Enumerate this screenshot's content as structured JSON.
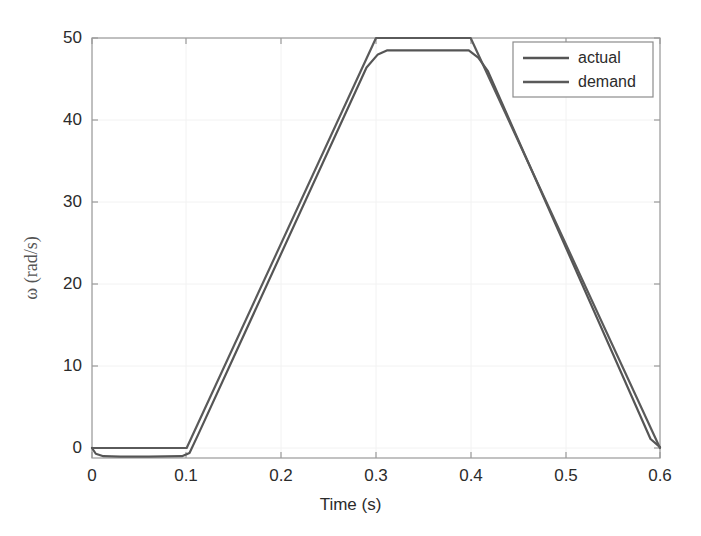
{
  "chart_data": {
    "type": "line",
    "title": "",
    "xlabel": "Time (s)",
    "ylabel": "ω (rad/s)",
    "xlim": [
      0,
      0.6
    ],
    "ylim": [
      -2.5,
      50
    ],
    "xticks": [
      0,
      0.1,
      0.2,
      0.3,
      0.4,
      0.5,
      0.6
    ],
    "xticklabels": [
      "0",
      "0.1",
      "0.2",
      "0.3",
      "0.4",
      "0.5",
      "0.6"
    ],
    "yticks": [
      0,
      10,
      20,
      30,
      40,
      50
    ],
    "yticklabels": [
      "0",
      "10",
      "20",
      "30",
      "40",
      "50"
    ],
    "grid": true,
    "grid_color": "#f2f2f2",
    "axes_color": "#8c8c8c",
    "legend_position": "upper right",
    "series": [
      {
        "name": "actual",
        "color": "#555555",
        "linewidth": 2.2,
        "x": [
          0.0,
          0.004,
          0.012,
          0.03,
          0.06,
          0.095,
          0.103,
          0.112,
          0.29,
          0.302,
          0.312,
          0.398,
          0.408,
          0.418,
          0.59,
          0.6
        ],
        "y": [
          0.0,
          -0.7,
          -1.0,
          -1.05,
          -1.05,
          -1.0,
          -0.6,
          1.6,
          46.4,
          48.0,
          48.5,
          48.5,
          47.6,
          46.0,
          1.1,
          0.1
        ]
      },
      {
        "name": "demand",
        "color": "#5a5a5a",
        "linewidth": 2.2,
        "x": [
          0.0,
          0.05,
          0.1,
          0.3,
          0.4,
          0.6
        ],
        "y": [
          0.0,
          0.0,
          0.0,
          50.0,
          50.0,
          0.0
        ]
      }
    ],
    "legend": [
      {
        "label": "actual",
        "color": "#555555"
      },
      {
        "label": "demand",
        "color": "#5a5a5a"
      }
    ]
  },
  "axis": {
    "xticklabels": [
      "0",
      "0.1",
      "0.2",
      "0.3",
      "0.4",
      "0.5",
      "0.6"
    ],
    "yticklabels": [
      "50",
      "40",
      "30",
      "20",
      "10",
      "0"
    ],
    "xlabel": "Time (s)",
    "ylabel": "ω (rad/s)"
  },
  "legend": {
    "items": [
      "actual",
      "demand"
    ]
  }
}
